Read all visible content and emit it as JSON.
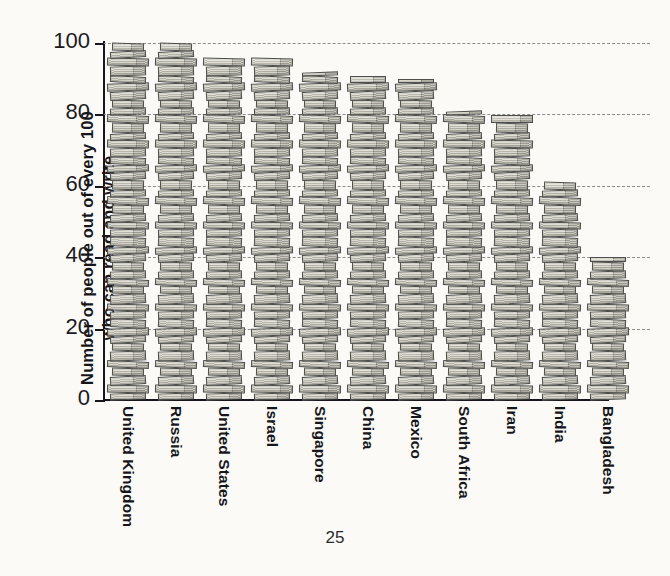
{
  "page": {
    "number": "25",
    "background_color": "#fbfaf7",
    "ink_color": "#16161a"
  },
  "chart_data": {
    "type": "bar",
    "title": "",
    "subtitle": "",
    "xlabel": "",
    "ylabel": "Number of people out of every 100\nwho can read and write",
    "ylim": [
      0,
      100
    ],
    "yticks": [
      0,
      20,
      40,
      60,
      80,
      100
    ],
    "ytick_labels": [
      "0",
      "20",
      "40",
      "60",
      "80",
      "100"
    ],
    "grid": "horizontal-dashed",
    "legend": "none",
    "pictorial_unit": "stack-of-books",
    "categories": [
      "United Kingdom",
      "Russia",
      "United States",
      "Israel",
      "Singapore",
      "China",
      "Mexico",
      "South Africa",
      "Iran",
      "India",
      "Bangladesh"
    ],
    "values": [
      100,
      100,
      96,
      96,
      92,
      91,
      90,
      81,
      80,
      61,
      40
    ],
    "series": [
      {
        "name": "Literacy rate per 100 people",
        "values": [
          100,
          100,
          96,
          96,
          92,
          91,
          90,
          81,
          80,
          61,
          40
        ]
      }
    ],
    "colors": {
      "book_light": "#d8d5cb",
      "book_mid": "#c0bdb2",
      "book_dark": "#a9a69a",
      "book_outline": "#4e4e4c",
      "gridline": "#8d8d8d",
      "axis": "#17171b"
    }
  }
}
